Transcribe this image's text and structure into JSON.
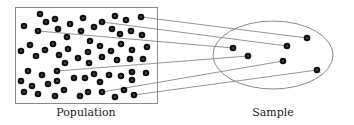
{
  "diagram": {
    "type": "population-sampling",
    "labels": {
      "population": "Population",
      "sample": "Sample"
    },
    "colors": {
      "dot": "#111111",
      "dot_center": "#555555",
      "frame": "#8a8a8a",
      "line": "#7a7a7a",
      "background": "#ffffff"
    },
    "population_box": {
      "x": 15,
      "y": 7,
      "width": 142,
      "height": 96
    },
    "sample_ellipse": {
      "cx": 273,
      "cy": 55,
      "rx": 60,
      "ry": 34
    },
    "population_dots": [
      [
        40,
        14
      ],
      [
        46,
        22
      ],
      [
        55,
        19
      ],
      [
        24,
        26
      ],
      [
        38,
        31
      ],
      [
        58,
        29
      ],
      [
        70,
        24
      ],
      [
        83,
        18
      ],
      [
        81,
        31
      ],
      [
        94,
        27
      ],
      [
        102,
        22
      ],
      [
        115,
        16
      ],
      [
        112,
        29
      ],
      [
        126,
        20
      ],
      [
        120,
        34
      ],
      [
        131,
        31
      ],
      [
        141,
        17
      ],
      [
        142,
        35
      ],
      [
        67,
        37
      ],
      [
        90,
        41
      ],
      [
        21,
        51
      ],
      [
        30,
        45
      ],
      [
        36,
        56
      ],
      [
        45,
        50
      ],
      [
        53,
        44
      ],
      [
        59,
        55
      ],
      [
        68,
        49
      ],
      [
        65,
        63
      ],
      [
        78,
        58
      ],
      [
        88,
        52
      ],
      [
        89,
        63
      ],
      [
        100,
        46
      ],
      [
        102,
        57
      ],
      [
        111,
        51
      ],
      [
        117,
        60
      ],
      [
        121,
        44
      ],
      [
        130,
        59
      ],
      [
        132,
        50
      ],
      [
        143,
        59
      ],
      [
        147,
        47
      ],
      [
        28,
        71
      ],
      [
        57,
        71
      ],
      [
        42,
        75
      ],
      [
        21,
        81
      ],
      [
        32,
        86
      ],
      [
        48,
        84
      ],
      [
        57,
        81
      ],
      [
        64,
        90
      ],
      [
        74,
        78
      ],
      [
        85,
        78
      ],
      [
        94,
        74
      ],
      [
        100,
        82
      ],
      [
        109,
        75
      ],
      [
        121,
        76
      ],
      [
        132,
        72
      ],
      [
        132,
        80
      ],
      [
        146,
        73
      ],
      [
        24,
        92
      ],
      [
        38,
        94
      ],
      [
        55,
        96
      ],
      [
        80,
        96
      ],
      [
        88,
        92
      ],
      [
        102,
        92
      ],
      [
        115,
        97
      ],
      [
        124,
        90
      ],
      [
        134,
        95
      ]
    ],
    "sample_dots": [
      [
        307,
        38
      ],
      [
        287,
        46
      ],
      [
        233,
        48
      ],
      [
        248,
        56
      ],
      [
        283,
        61
      ],
      [
        317,
        70
      ]
    ],
    "connections": [
      {
        "from": [
          141,
          17
        ],
        "to": [
          307,
          38
        ]
      },
      {
        "from": [
          102,
          22
        ],
        "to": [
          287,
          46
        ]
      },
      {
        "from": [
          38,
          31
        ],
        "to": [
          233,
          48
        ]
      },
      {
        "from": [
          57,
          71
        ],
        "to": [
          248,
          56
        ]
      },
      {
        "from": [
          102,
          92
        ],
        "to": [
          283,
          61
        ]
      },
      {
        "from": [
          134,
          95
        ],
        "to": [
          317,
          70
        ]
      }
    ],
    "label_positions": {
      "population": {
        "x": 86,
        "y": 106
      },
      "sample": {
        "x": 273,
        "y": 106
      }
    }
  }
}
